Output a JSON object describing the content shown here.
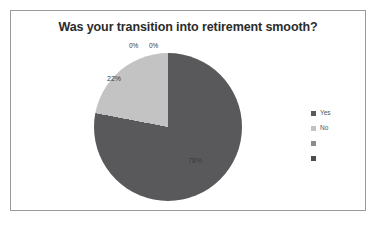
{
  "chart_data": {
    "type": "pie",
    "title": "Was your transition into retirement smooth?",
    "categories": [
      "Yes",
      "No",
      "",
      ""
    ],
    "values": [
      78,
      22,
      0,
      0
    ],
    "data_labels": [
      "78%",
      "22%",
      "0%",
      "0%"
    ],
    "colors": [
      "#59595b",
      "#c3c3c3",
      "#8c8c8c",
      "#4d4d4d"
    ],
    "legend_position": "right",
    "grid": false,
    "xlabel": "",
    "ylabel": "",
    "units": "percent",
    "start_angle_deg": 0,
    "direction": "clockwise"
  },
  "legend": {
    "items": [
      {
        "label": "Yes",
        "color": "#59595b"
      },
      {
        "label": "No",
        "color": "#c3c3c3"
      },
      {
        "label": "",
        "color": "#8c8c8c"
      },
      {
        "label": "",
        "color": "#4d4d4d"
      }
    ]
  },
  "frame": {
    "border_color": "#9a9a9a",
    "background": "#ffffff"
  }
}
